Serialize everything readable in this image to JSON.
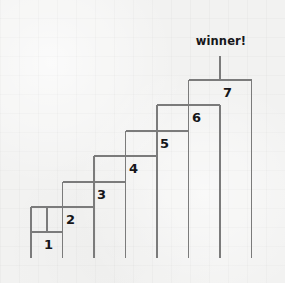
{
  "figure": {
    "name": "single-elimination-staircase-bracket",
    "background_color": "#f2f2f1",
    "line_color": "#7b7b7b",
    "text_color": "#16161a",
    "width": 285,
    "height": 283
  },
  "winner": {
    "label": "winner!",
    "x": 221,
    "y": 42,
    "stem_top_y": 56,
    "stem_bottom_y": 80
  },
  "leaves": {
    "count": 8,
    "bottom_y": 258,
    "x_positions": [
      31,
      62.5,
      94,
      125.5,
      157,
      188.5,
      220,
      251.5
    ]
  },
  "matches": [
    {
      "number": "1",
      "bar_y": 232,
      "left_x": 31,
      "right_x": 62.5,
      "label_x": 44,
      "label_y": 238
    },
    {
      "number": "2",
      "bar_y": 207,
      "left_x": 31,
      "right_x": 94,
      "label_x": 66,
      "label_y": 213
    },
    {
      "number": "3",
      "bar_y": 182,
      "left_x": 62.5,
      "right_x": 125.5,
      "label_x": 97,
      "label_y": 188
    },
    {
      "number": "4",
      "bar_y": 156,
      "left_x": 94,
      "right_x": 157,
      "label_x": 129,
      "label_y": 162
    },
    {
      "number": "5",
      "bar_y": 131,
      "left_x": 125.5,
      "right_x": 188.5,
      "label_x": 160,
      "label_y": 137
    },
    {
      "number": "6",
      "bar_y": 105,
      "left_x": 157,
      "right_x": 220,
      "label_x": 192,
      "label_y": 111
    },
    {
      "number": "7",
      "bar_y": 80,
      "left_x": 188.5,
      "right_x": 251.5,
      "label_x": 223,
      "label_y": 86
    }
  ]
}
